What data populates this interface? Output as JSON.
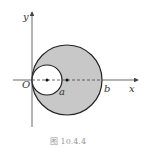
{
  "figure": {
    "caption": "图   10.4.4",
    "axes": {
      "x_label": "x",
      "y_label": "y",
      "origin_label": "O"
    },
    "points": {
      "a_label": "a",
      "b_label": "b"
    },
    "colors": {
      "shade": "#c8c8c8",
      "stroke": "#222222",
      "axis": "#444444",
      "caption": "#999999"
    }
  }
}
